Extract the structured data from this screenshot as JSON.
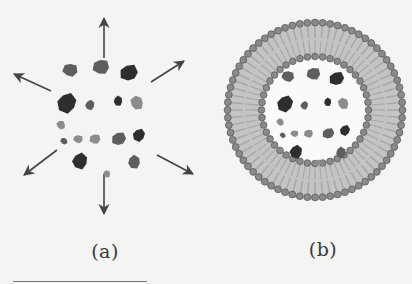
{
  "figure": {
    "panels": [
      {
        "id": "a",
        "label": "(a)",
        "description": "Free particles dispersing outward",
        "center": [
          104,
          113
        ],
        "arrow_count": 6
      },
      {
        "id": "b",
        "label": "(b)",
        "description": "Particles encapsulated inside a lipid bilayer vesicle",
        "center": [
          315,
          110
        ],
        "outer_radius": 90,
        "inner_radius": 52
      }
    ],
    "colors": {
      "background": "#f4f4f2",
      "arrow": "#444444",
      "head_group": "#8a8a8a",
      "head_outline": "#5a5a5a",
      "tail": "#a9a9a9",
      "particle_dark": "#2e2e2e",
      "particle_mid": "#5e5e5e",
      "particle_light": "#8c8c8c"
    },
    "particles": [
      {
        "dx": -34,
        "dy": -43,
        "r": 8,
        "tone": "mid"
      },
      {
        "dx": -3,
        "dy": -46,
        "r": 9,
        "tone": "mid"
      },
      {
        "dx": 25,
        "dy": -40,
        "r": 10,
        "tone": "dark"
      },
      {
        "dx": -37,
        "dy": -10,
        "r": 11,
        "tone": "dark"
      },
      {
        "dx": -14,
        "dy": -8,
        "r": 5.5,
        "tone": "mid"
      },
      {
        "dx": 14,
        "dy": -12,
        "r": 5.5,
        "tone": "dark"
      },
      {
        "dx": 33,
        "dy": -10,
        "r": 7.5,
        "tone": "light"
      },
      {
        "dx": -43,
        "dy": 12,
        "r": 5,
        "tone": "light"
      },
      {
        "dx": -40,
        "dy": 28,
        "r": 4,
        "tone": "mid"
      },
      {
        "dx": -26,
        "dy": 26,
        "r": 5,
        "tone": "light"
      },
      {
        "dx": -9,
        "dy": 26,
        "r": 6,
        "tone": "light"
      },
      {
        "dx": 15,
        "dy": 26,
        "r": 8,
        "tone": "mid"
      },
      {
        "dx": 35,
        "dy": 22,
        "r": 7,
        "tone": "dark"
      },
      {
        "dx": -24,
        "dy": 48,
        "r": 9,
        "tone": "dark"
      },
      {
        "dx": 30,
        "dy": 49,
        "r": 7.5,
        "tone": "mid"
      },
      {
        "dx": 3,
        "dy": 61,
        "r": 4,
        "tone": "light"
      }
    ]
  },
  "arrows": [
    {
      "x1": 104,
      "y1": 58,
      "x2": 104,
      "y2": 18
    },
    {
      "x1": 151,
      "y1": 82,
      "x2": 184,
      "y2": 61
    },
    {
      "x1": 51,
      "y1": 91,
      "x2": 14,
      "y2": 74
    },
    {
      "x1": 157,
      "y1": 155,
      "x2": 193,
      "y2": 174
    },
    {
      "x1": 57,
      "y1": 150,
      "x2": 24,
      "y2": 175
    },
    {
      "x1": 104,
      "y1": 174,
      "x2": 104,
      "y2": 214
    }
  ],
  "labels": {
    "a": "(a)",
    "b": "(b)"
  }
}
